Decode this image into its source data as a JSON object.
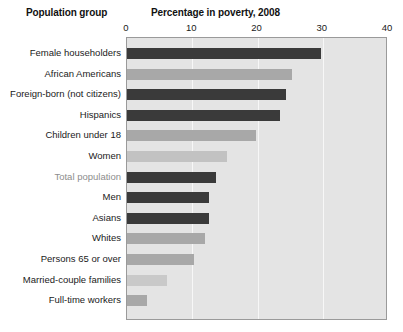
{
  "header": {
    "group_title": "Population group",
    "value_title": "Percentage in poverty, 2008"
  },
  "chart_data": {
    "type": "bar",
    "orientation": "horizontal",
    "title": "Percentage in poverty, 2008",
    "xlabel": "Percentage in poverty, 2008",
    "ylabel": "Population group",
    "xlim": [
      0,
      40
    ],
    "xticks": [
      0,
      10,
      20,
      30,
      40
    ],
    "xtick_labels": [
      "0",
      "10",
      "20",
      "30",
      "40"
    ],
    "grid": true,
    "grid_axis": "x",
    "legend": "none",
    "plot_background": "#e4e4e4",
    "gridline_color": "#f7f7f7",
    "categories": [
      "Female householders",
      "African Americans",
      "Foreign-born (not citizens)",
      "Hispanics",
      "Children under 18",
      "Women",
      "Total population",
      "Men",
      "Asians",
      "Whites",
      "Persons 65 or over",
      "Married-couple families",
      "Full-time workers"
    ],
    "values": [
      29.7,
      25.3,
      24.4,
      23.5,
      19.8,
      15.3,
      13.6,
      12.6,
      12.6,
      11.9,
      10.2,
      6.1,
      3.1
    ],
    "bar_colors": [
      "#3a3a3a",
      "#a8a8a8",
      "#3a3a3a",
      "#3a3a3a",
      "#a8a8a8",
      "#c2c2c2",
      "#3a3a3a",
      "#3a3a3a",
      "#3a3a3a",
      "#a8a8a8",
      "#a8a8a8",
      "#c9c9c9",
      "#a8a8a8"
    ],
    "highlight_category": "Total population",
    "highlight_label_color": "#8d8d8d"
  }
}
